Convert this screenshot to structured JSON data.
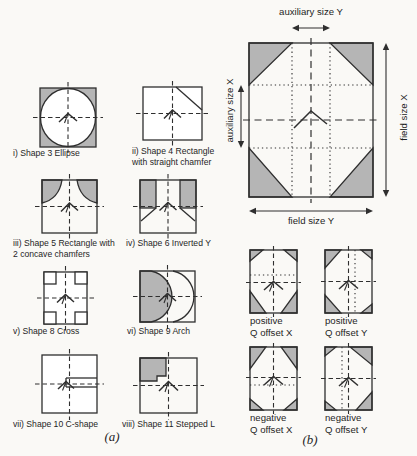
{
  "figure_type": "scanned-paper-figure",
  "colors": {
    "line": "#2f2f2f",
    "shade": "#b5b5b5",
    "background": "#faf9f6",
    "aperture": "#ffffff"
  },
  "panel_a": {
    "label": "(a)",
    "shapes": [
      {
        "name": "ellipse",
        "caption_line1": "i) Shape 3 Ellipse",
        "caption_line2": ""
      },
      {
        "name": "rectangle-straight-chamfer",
        "caption_line1": "ii) Shape 4 Rectangle",
        "caption_line2": "with straight chamfer"
      },
      {
        "name": "rectangle-2-concave-chamfers",
        "caption_line1": "iii) Shape 5 Rectangle with",
        "caption_line2": "2 concave chamfers"
      },
      {
        "name": "inverted-y",
        "caption_line1": "iv) Shape 6 Inverted Y",
        "caption_line2": ""
      },
      {
        "name": "cross",
        "caption_line1": "v) Shape 8 Cross",
        "caption_line2": ""
      },
      {
        "name": "arch",
        "caption_line1": "vi) Shape 9 Arch",
        "caption_line2": ""
      },
      {
        "name": "c-shape",
        "caption_line1": "vii) Shape 10 C-shape",
        "caption_line2": ""
      },
      {
        "name": "stepped-l",
        "caption_line1": "viii) Shape 11 Stepped L",
        "caption_line2": ""
      }
    ]
  },
  "panel_b": {
    "label": "(b)",
    "dimensions": {
      "top": "auxiliary size Y",
      "left": "auxiliary size X",
      "right": "field size X",
      "bottom": "field size Y"
    },
    "offsets": [
      {
        "name": "positive-q-offset-x",
        "line1": "positive",
        "line2": "Q offset X"
      },
      {
        "name": "positive-q-offset-y",
        "line1": "positive",
        "line2": "Q offset Y"
      },
      {
        "name": "negative-q-offset-x",
        "line1": "negative",
        "line2": "Q offset X"
      },
      {
        "name": "negative-q-offset-y",
        "line1": "negative",
        "line2": "Q offset Y"
      }
    ]
  }
}
